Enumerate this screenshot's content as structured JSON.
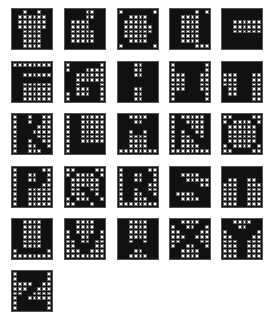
{
  "colors": {
    "on": "#111111",
    "off": "#ffffff",
    "grid": "#666666"
  },
  "layout": {
    "cols_x": [
      11,
      64,
      117,
      169,
      221
    ],
    "rows_y": [
      8,
      61,
      113,
      166,
      218,
      270
    ],
    "size": 42
  },
  "letters": [
    {
      "char": "A",
      "rows": [
        "11011011",
        "10000001",
        "10000001",
        "10000001",
        "11000011",
        "11000011",
        "11000011",
        "11000011"
      ]
    },
    {
      "char": "B",
      "rows": [
        "11110011",
        "11110011",
        "10000111",
        "10000111",
        "10000011",
        "10000011",
        "10000011",
        "11111111"
      ]
    },
    {
      "char": "C",
      "rows": [
        "01111110",
        "11000011",
        "10000011",
        "10000001",
        "10000001",
        "10000011",
        "11000011",
        "01111110"
      ]
    },
    {
      "char": "D",
      "rows": [
        "11111010",
        "11000011",
        "11000011",
        "11000011",
        "11000011",
        "11000011",
        "11000011",
        "11111000"
      ]
    },
    {
      "char": "E",
      "rows": [
        "11111111",
        "11111111",
        "11000000",
        "11000000",
        "11000000",
        "11111111",
        "11111111",
        "11111111"
      ]
    },
    {
      "char": "F",
      "rows": [
        "00000000",
        "11111111",
        "11000000",
        "11111111",
        "11000000",
        "11000000",
        "11000000",
        "11000000"
      ]
    },
    {
      "char": "G",
      "rows": [
        "01111110",
        "01110000",
        "11000000",
        "11000000",
        "11011110",
        "11000110",
        "01000110",
        "01111110"
      ]
    },
    {
      "char": "H",
      "rows": [
        "11100111",
        "11100111",
        "11100111",
        "11111111",
        "11111111",
        "11100111",
        "11100111",
        "11100111"
      ]
    },
    {
      "char": "I",
      "rows": [
        "01111110",
        "01111110",
        "00011100",
        "00011100",
        "00011100",
        "00011100",
        "01111110",
        "01111110"
      ]
    },
    {
      "char": "J",
      "rows": [
        "11111111",
        "11111111",
        "00011100",
        "00011100",
        "00011100",
        "10011100",
        "10011100",
        "11111100"
      ]
    },
    {
      "char": "K",
      "rows": [
        "01101100",
        "01101100",
        "01111000",
        "01110000",
        "01111000",
        "01101100",
        "01100110",
        "01100011"
      ]
    },
    {
      "char": "L",
      "rows": [
        "01100000",
        "01100000",
        "01100000",
        "01100000",
        "01100000",
        "01100000",
        "01111111",
        "01111111"
      ]
    },
    {
      "char": "M",
      "rows": [
        "11000011",
        "11100111",
        "11111111",
        "11011011",
        "11000011",
        "11000011",
        "11000011",
        "00000000"
      ]
    },
    {
      "char": "N",
      "rows": [
        "01000001",
        "01100001",
        "01110001",
        "01011001",
        "01001101",
        "01000111",
        "01000011",
        "00000000"
      ]
    },
    {
      "char": "O",
      "rows": [
        "00111100",
        "01000010",
        "10000001",
        "10000001",
        "10000001",
        "10000001",
        "01000010",
        "00111100"
      ]
    },
    {
      "char": "P",
      "rows": [
        "01111100",
        "01100110",
        "01100110",
        "01111100",
        "01100000",
        "01100000",
        "01100000",
        "01100000"
      ]
    },
    {
      "char": "Q",
      "rows": [
        "00111100",
        "01000010",
        "10000001",
        "10000001",
        "10011001",
        "10001101",
        "01000110",
        "00111011"
      ]
    },
    {
      "char": "R",
      "rows": [
        "01111100",
        "01100110",
        "01100110",
        "01111100",
        "01101100",
        "01100110",
        "01100011",
        "00000000"
      ]
    },
    {
      "char": "S",
      "rows": [
        "11111111",
        "11000011",
        "11100000",
        "11111100",
        "11111111",
        "10000111",
        "11000011",
        "11111111"
      ]
    },
    {
      "char": "T",
      "rows": [
        "11111111",
        "11111111",
        "10011001",
        "00011000",
        "00011000",
        "00011000",
        "00011000",
        "00011000"
      ]
    },
    {
      "char": "U",
      "rows": [
        "11000011",
        "11000011",
        "11000011",
        "11000011",
        "11000011",
        "11000011",
        "01111110",
        "00000000"
      ]
    },
    {
      "char": "V",
      "rows": [
        "11000011",
        "11000011",
        "01000010",
        "01100110",
        "00100100",
        "00111100",
        "00011000",
        "00000000"
      ]
    },
    {
      "char": "W",
      "rows": [
        "11000011",
        "11000011",
        "11000011",
        "11000011",
        "11011011",
        "11111111",
        "11100111",
        "11000011"
      ]
    },
    {
      "char": "X",
      "rows": [
        "11000011",
        "01100110",
        "00111100",
        "00011000",
        "00111100",
        "01100110",
        "11000011",
        "11000011"
      ]
    },
    {
      "char": "Y",
      "rows": [
        "11000011",
        "11100111",
        "01111110",
        "00111100",
        "00011000",
        "00011000",
        "00011000",
        "00011000"
      ]
    },
    {
      "char": "Z",
      "rows": [
        "01111110",
        "01111110",
        "00001100",
        "00011000",
        "00110000",
        "01100000",
        "01111110",
        "01111110"
      ]
    }
  ]
}
